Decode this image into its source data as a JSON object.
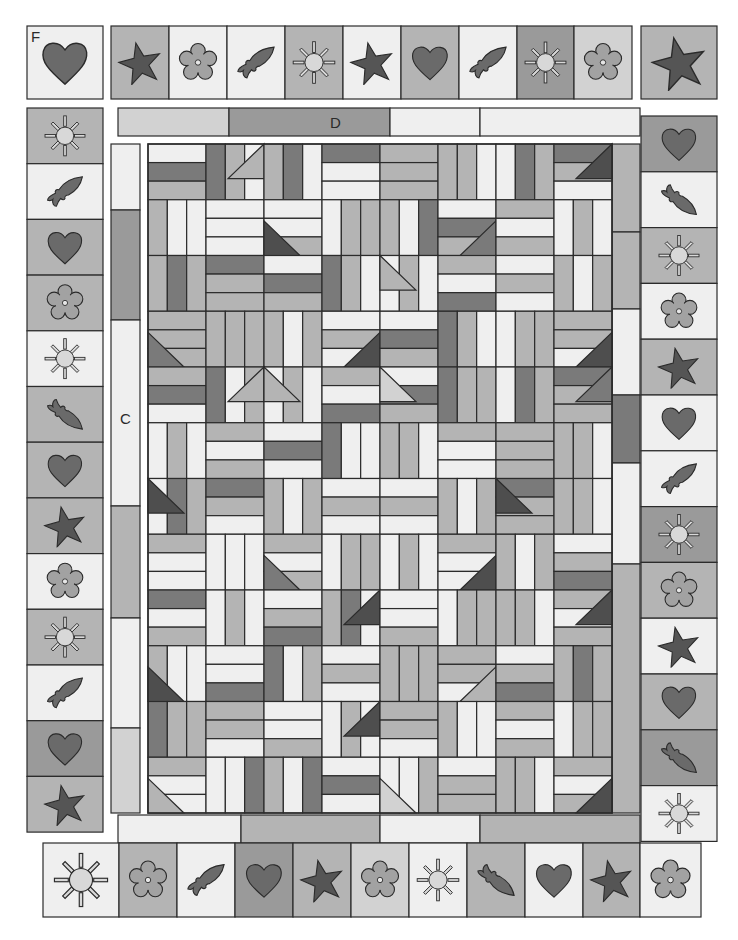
{
  "palette": {
    "white": "#efefef",
    "light": "#d2d2d2",
    "mid": "#b4b4b4",
    "midDark": "#9a9a9a",
    "dark": "#7a7a7a",
    "darkest": "#4e4e4e",
    "appliqueDark": "#6a6a6a",
    "appliqueMid": "#9c9c9c",
    "appliqueLight": "#dedede",
    "line": "#2b2b2b"
  },
  "labels": {
    "corner_f": "F",
    "inner_border_top": "D",
    "inner_border_left": "C"
  },
  "corner_block_top_left": {
    "x": 27,
    "y": 26,
    "w": 76,
    "h": 73,
    "bg": "white",
    "motif": "heart"
  },
  "corner_block_top_right": {
    "x": 641,
    "y": 26,
    "w": 76,
    "h": 73,
    "bg": "mid",
    "motif": "star"
  },
  "top_border": {
    "x": 111,
    "y": 26,
    "h": 73,
    "cells": [
      {
        "w": 58,
        "bg": "mid",
        "motif": "star"
      },
      {
        "w": 58,
        "bg": "white",
        "motif": "flower"
      },
      {
        "w": 58,
        "bg": "white",
        "motif": "fish"
      },
      {
        "w": 58,
        "bg": "mid",
        "motif": "sun"
      },
      {
        "w": 58,
        "bg": "white",
        "motif": "star"
      },
      {
        "w": 58,
        "bg": "mid",
        "motif": "heart"
      },
      {
        "w": 58,
        "bg": "white",
        "motif": "fish"
      },
      {
        "w": 57,
        "bg": "midDark",
        "motif": "sun"
      },
      {
        "w": 58,
        "bg": "light",
        "motif": "flower"
      }
    ]
  },
  "left_border": {
    "x": 27,
    "y": 108,
    "w": 76,
    "cells": [
      {
        "h": 55.7,
        "bg": "mid",
        "motif": "sun"
      },
      {
        "h": 55.7,
        "bg": "white",
        "motif": "fish"
      },
      {
        "h": 55.7,
        "bg": "mid",
        "motif": "heart"
      },
      {
        "h": 55.7,
        "bg": "mid",
        "motif": "flower"
      },
      {
        "h": 55.7,
        "bg": "white",
        "motif": "sun"
      },
      {
        "h": 55.7,
        "bg": "mid",
        "motif": "fish-down"
      },
      {
        "h": 55.7,
        "bg": "mid",
        "motif": "heart"
      },
      {
        "h": 55.7,
        "bg": "mid",
        "motif": "star"
      },
      {
        "h": 55.7,
        "bg": "white",
        "motif": "flower"
      },
      {
        "h": 55.7,
        "bg": "mid",
        "motif": "sun"
      },
      {
        "h": 55.7,
        "bg": "white",
        "motif": "fish"
      },
      {
        "h": 55.7,
        "bg": "midDark",
        "motif": "heart"
      },
      {
        "h": 55.7,
        "bg": "mid",
        "motif": "star"
      }
    ]
  },
  "right_border": {
    "x": 641,
    "y": 116,
    "w": 76,
    "cells": [
      {
        "h": 55.8,
        "bg": "midDark",
        "motif": "heart"
      },
      {
        "h": 55.8,
        "bg": "white",
        "motif": "fish-down"
      },
      {
        "h": 55.8,
        "bg": "mid",
        "motif": "sun"
      },
      {
        "h": 55.8,
        "bg": "white",
        "motif": "flower"
      },
      {
        "h": 55.8,
        "bg": "mid",
        "motif": "star"
      },
      {
        "h": 55.8,
        "bg": "white",
        "motif": "heart"
      },
      {
        "h": 55.8,
        "bg": "white",
        "motif": "fish"
      },
      {
        "h": 55.8,
        "bg": "midDark",
        "motif": "sun"
      },
      {
        "h": 55.8,
        "bg": "mid",
        "motif": "flower"
      },
      {
        "h": 55.8,
        "bg": "white",
        "motif": "star"
      },
      {
        "h": 55.8,
        "bg": "mid",
        "motif": "heart"
      },
      {
        "h": 55.8,
        "bg": "midDark",
        "motif": "fish-down"
      },
      {
        "h": 55.8,
        "bg": "white",
        "motif": "sun"
      }
    ]
  },
  "bottom_border": {
    "x": 43,
    "y": 843,
    "h": 74,
    "cells": [
      {
        "w": 76,
        "bg": "white",
        "motif": "sun"
      },
      {
        "w": 58,
        "bg": "mid",
        "motif": "flower"
      },
      {
        "w": 58,
        "bg": "white",
        "motif": "fish"
      },
      {
        "w": 58,
        "bg": "midDark",
        "motif": "heart"
      },
      {
        "w": 58,
        "bg": "mid",
        "motif": "star"
      },
      {
        "w": 58,
        "bg": "light",
        "motif": "flower"
      },
      {
        "w": 58,
        "bg": "white",
        "motif": "sun"
      },
      {
        "w": 58,
        "bg": "mid",
        "motif": "fish-down"
      },
      {
        "w": 58,
        "bg": "white",
        "motif": "heart"
      },
      {
        "w": 57,
        "bg": "mid",
        "motif": "star"
      },
      {
        "w": 61,
        "bg": "white",
        "motif": "flower"
      }
    ]
  },
  "inner_border_top": {
    "x": 118,
    "y": 108,
    "h": 28,
    "segments": [
      {
        "w": 111,
        "bg": "light"
      },
      {
        "w": 161,
        "bg": "midDark"
      },
      {
        "w": 90,
        "bg": "white"
      },
      {
        "w": 160,
        "bg": "white"
      }
    ]
  },
  "inner_border_bottom": {
    "x": 118,
    "y": 815,
    "h": 28,
    "segments": [
      {
        "w": 123,
        "bg": "white"
      },
      {
        "w": 139,
        "bg": "mid"
      },
      {
        "w": 100,
        "bg": "white"
      },
      {
        "w": 160,
        "bg": "mid"
      }
    ]
  },
  "inner_border_left": {
    "x": 111,
    "y": 144,
    "w": 29,
    "segments": [
      {
        "h": 66,
        "bg": "white"
      },
      {
        "h": 110,
        "bg": "midDark"
      },
      {
        "h": 186,
        "bg": "white"
      },
      {
        "h": 112,
        "bg": "mid"
      },
      {
        "h": 110,
        "bg": "white"
      },
      {
        "h": 85,
        "bg": "light"
      }
    ]
  },
  "inner_border_right": {
    "x": 612,
    "y": 144,
    "w": 28,
    "segments": [
      {
        "h": 88,
        "bg": "mid"
      },
      {
        "h": 77,
        "bg": "mid"
      },
      {
        "h": 86,
        "bg": "white"
      },
      {
        "h": 68,
        "bg": "dark"
      },
      {
        "h": 101,
        "bg": "white"
      },
      {
        "h": 249,
        "bg": "mid"
      }
    ]
  },
  "center_field": {
    "x": 148,
    "y": 144,
    "w": 464,
    "h": 669,
    "cols": 4,
    "rows": 6,
    "blocks": [
      {
        "orient": "h",
        "colors": [
          "white",
          "dark",
          "mid",
          "white",
          "white"
        ],
        "tri": "tr",
        "tri_color": "mid"
      },
      {
        "orient": "v",
        "colors": [
          "mid",
          "dark",
          "white",
          "white",
          "mid"
        ],
        "tri": "bl",
        "tri_color": "darkest"
      },
      {
        "orient": "h",
        "colors": [
          "mid",
          "mid",
          "mid",
          "white",
          "dark"
        ],
        "tri": "br",
        "tri_color": "dark"
      },
      {
        "orient": "v",
        "colors": [
          "white",
          "dark",
          "mid",
          "white",
          "mid"
        ],
        "tri": "tr",
        "tri_color": "darkest"
      },
      {
        "orient": "v",
        "colors": [
          "mid",
          "dark",
          "mid",
          "mid",
          "mid"
        ],
        "tri": "bl",
        "tri_color": "dark"
      },
      {
        "orient": "h",
        "colors": [
          "white",
          "dark",
          "mid",
          "white",
          "mid"
        ],
        "tri": "br",
        "tri_color": "darkest"
      },
      {
        "orient": "v",
        "colors": [
          "white",
          "mid",
          "white",
          "dark",
          "mid"
        ],
        "tri": "tl",
        "tri_color": "mid"
      },
      {
        "orient": "h",
        "colors": [
          "white",
          "mid",
          "white",
          "mid",
          "mid"
        ],
        "tri": "br",
        "tri_color": "darkest"
      },
      {
        "orient": "h",
        "colors": [
          "mid",
          "dark",
          "white",
          "mid",
          "white"
        ],
        "tri": "tr",
        "tri_color": "mid"
      },
      {
        "orient": "v",
        "colors": [
          "white",
          "mid",
          "white",
          "dark",
          "white"
        ],
        "tri": "tl",
        "tri_color": "mid"
      },
      {
        "orient": "h",
        "colors": [
          "white",
          "dark",
          "mid",
          "mid",
          "white"
        ],
        "tri": "tl",
        "tri_color": "light"
      },
      {
        "orient": "v",
        "colors": [
          "white",
          "dark",
          "mid",
          "mid",
          "mid"
        ],
        "tri": "tr",
        "tri_color": "dark"
      },
      {
        "orient": "v",
        "colors": [
          "white",
          "dark",
          "mid",
          "white",
          "white"
        ],
        "tri": "tl",
        "tri_color": "darkest"
      },
      {
        "orient": "v",
        "colors": [
          "mid",
          "white",
          "mid",
          "white",
          "mid"
        ],
        "tri": "bl",
        "tri_color": "dark"
      },
      {
        "orient": "h",
        "colors": [
          "white",
          "mid",
          "white",
          "mid",
          "white"
        ],
        "tri": "br",
        "tri_color": "darkest"
      },
      {
        "orient": "h",
        "colors": [
          "dark",
          "mid",
          "mid",
          "white",
          "mid"
        ],
        "tri": "tl",
        "tri_color": "darkest"
      },
      {
        "orient": "h",
        "colors": [
          "dark",
          "white",
          "mid",
          "white",
          "white"
        ],
        "tri": "bl",
        "tri_color": "darkest"
      },
      {
        "orient": "h",
        "colors": [
          "white",
          "mid",
          "dark",
          "white",
          "mid"
        ],
        "tri": "tr",
        "tri_color": "darkest"
      },
      {
        "orient": "h",
        "colors": [
          "white",
          "white",
          "mid",
          "mid",
          "mid"
        ],
        "tri": "br",
        "tri_color": "mid"
      },
      {
        "orient": "v",
        "colors": [
          "mid",
          "mid",
          "white",
          "mid",
          "dark"
        ],
        "tri": "tr",
        "tri_color": "darkest"
      },
      {
        "orient": "v",
        "colors": [
          "dark",
          "mid",
          "mid",
          "white",
          "white"
        ],
        "tri": "bl",
        "tri_color": "mid"
      },
      {
        "orient": "h",
        "colors": [
          "white",
          "white",
          "mid",
          "white",
          "dark"
        ],
        "tri": "tr",
        "tri_color": "darkest"
      },
      {
        "orient": "h",
        "colors": [
          "mid",
          "mid",
          "white",
          "white",
          "mid"
        ],
        "tri": "bl",
        "tri_color": "light"
      },
      {
        "orient": "h",
        "colors": [
          "mid",
          "white",
          "mid",
          "mid",
          "white"
        ],
        "tri": "br",
        "tri_color": "darkest"
      }
    ]
  }
}
